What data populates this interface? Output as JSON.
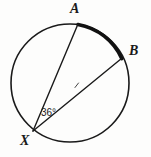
{
  "figure": {
    "type": "circle-inscribed-angle-diagram",
    "background_color": "#fdfdfc",
    "stroke_color": "#1a1a1a",
    "circle": {
      "center_x": 70,
      "center_y": 83,
      "radius": 59,
      "stroke_width": 1.6
    },
    "points": [
      {
        "name": "A",
        "label": "A",
        "x": 78,
        "y": 24,
        "label_x": 70,
        "label_y": 2
      },
      {
        "name": "B",
        "label": "B",
        "x": 121,
        "y": 58,
        "label_x": 129,
        "label_y": 44
      },
      {
        "name": "X",
        "label": "X",
        "x": 33,
        "y": 131,
        "label_x": 20,
        "label_y": 134
      }
    ],
    "chords": [
      {
        "name": "chord-XA",
        "from": "X",
        "to": "A",
        "x1": 33,
        "y1": 131,
        "x2": 78,
        "y2": 24,
        "stroke_width": 1.4
      },
      {
        "name": "chord-XB",
        "from": "X",
        "to": "B",
        "x1": 33,
        "y1": 131,
        "x2": 121,
        "y2": 58,
        "stroke_width": 1.4
      }
    ],
    "highlighted_arc": {
      "name": "arc-AB",
      "from": "A",
      "to": "B",
      "start_x": 78,
      "start_y": 24,
      "end_x": 121.5,
      "end_y": 58.5,
      "radius": 59,
      "stroke_width": 3.2,
      "sweep": 1,
      "large_arc": 0
    },
    "tick_mark": {
      "name": "midpoint-tick",
      "x": 76,
      "y": 85,
      "size": 3
    },
    "angle": {
      "name": "angle-at-X",
      "value": "36",
      "unit": "°",
      "text": "36°",
      "label_x": 41,
      "label_y": 108
    }
  }
}
